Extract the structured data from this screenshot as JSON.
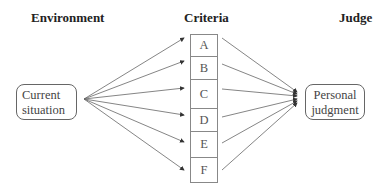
{
  "headers": {
    "environment": "Environment",
    "criteria": "Criteria",
    "judge": "Judge"
  },
  "environment_node": {
    "line1": "Current",
    "line2": "situation"
  },
  "judge_node": {
    "line1": "Personal",
    "line2": "judgment"
  },
  "criteria": [
    {
      "label": "A"
    },
    {
      "label": "B"
    },
    {
      "label": "C"
    },
    {
      "label": "D"
    },
    {
      "label": "E"
    },
    {
      "label": "F"
    }
  ]
}
